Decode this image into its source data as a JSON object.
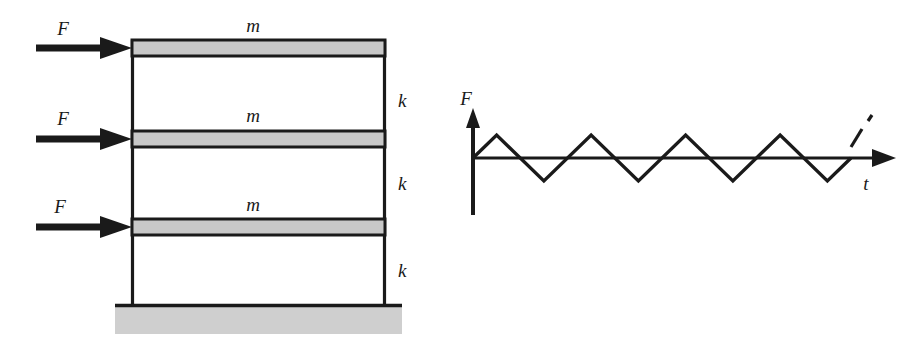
{
  "figure": {
    "panels": [
      {
        "id": "frame-diagram",
        "name": "three-storey-frame",
        "labels": {
          "mass_top": "m",
          "mass_middle": "m",
          "mass_bottom": "m",
          "force_top": "F",
          "force_middle": "F",
          "force_bottom": "F",
          "stiffness_top": "k",
          "stiffness_middle": "k",
          "stiffness_bottom": "k"
        },
        "colors": {
          "mass_fill": "#c8c8c8",
          "ground_fill": "#cfcfcf",
          "stroke": "#1a1a1a"
        }
      },
      {
        "id": "force-time-plot",
        "name": "force-time-history",
        "labels": {
          "y_axis": "F",
          "x_axis": "t"
        },
        "colors": {
          "stroke": "#1a1a1a"
        }
      }
    ]
  },
  "chart_data": {
    "type": "line",
    "title": "",
    "xlabel": "t",
    "ylabel": "F",
    "grid": false,
    "legend": null,
    "annotations": [
      "dashed continuation indicating the signal repeats"
    ],
    "series": [
      {
        "name": "triangular force",
        "waveform": "triangular",
        "amplitude": 1,
        "period": 1,
        "cycles": 4,
        "x": [
          0,
          0.25,
          0.75,
          1.25,
          1.75,
          2.25,
          2.75,
          3.25,
          3.75,
          4.0
        ],
        "y": [
          0,
          1,
          -1,
          1,
          -1,
          1,
          -1,
          1,
          -1,
          0
        ]
      }
    ],
    "xlim": [
      0,
      4.6
    ],
    "ylim": [
      -1.35,
      1.35
    ]
  }
}
